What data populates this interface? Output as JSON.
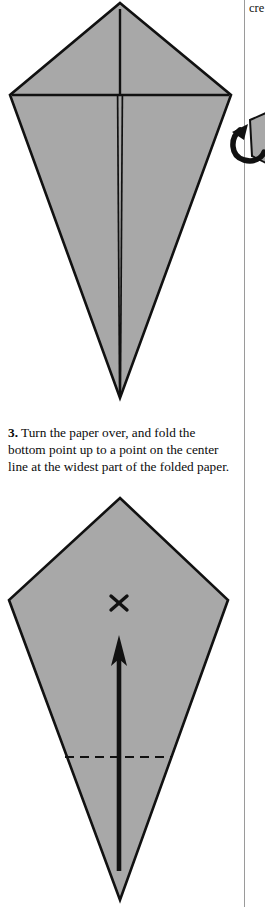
{
  "page": {
    "width": 265,
    "height": 907,
    "background": "#ffffff",
    "column_rule_color": "#9a9a9a"
  },
  "neighbor_column": {
    "clipped_text": "cre"
  },
  "symbols": {
    "turn_over_arrow": "turn-over-arrow",
    "x_mark": "×",
    "arrow_up": "fold-direction-arrow-up",
    "dashed_line": "valley-fold-line"
  },
  "caption": {
    "step_number": "3.",
    "text": "Turn the paper over, and fold the bottom point up to a point on the center line at the widest part of the folded paper."
  },
  "figures": [
    {
      "id": "figure-1",
      "name": "folded-kite-front",
      "description": "Kite shaped folded paper with center crease and two folded flaps",
      "fill": "#a8a8a8",
      "stroke": "#111111",
      "apex": [
        120,
        3
      ],
      "left_point": [
        10,
        95
      ],
      "right_point": [
        231,
        95
      ],
      "bottom_point": [
        120,
        398
      ],
      "crease_horizontal_y": 95,
      "center_line": true
    },
    {
      "id": "figure-2",
      "name": "folded-kite-back-with-fold-mark",
      "description": "Kite shaped folded paper flipped over, showing target X, upward fold arrow and dashed valley fold line",
      "fill": "#a8a8a8",
      "stroke": "#111111",
      "apex": [
        120,
        498
      ],
      "left_point": [
        9,
        600
      ],
      "right_point": [
        228,
        600
      ],
      "bottom_point": [
        120,
        900
      ],
      "x_mark_position": [
        119,
        604
      ],
      "arrow_tip": [
        119,
        639
      ],
      "arrow_tail": [
        119,
        871
      ],
      "dashed_fold_line_y": 757,
      "dashed_fold_line_x_range": [
        65,
        172
      ]
    }
  ]
}
